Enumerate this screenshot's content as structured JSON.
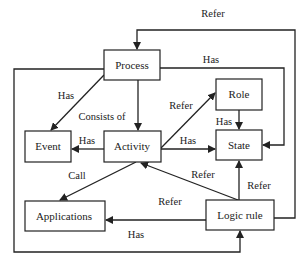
{
  "diagram": {
    "nodes": {
      "process": {
        "label": "Process"
      },
      "role": {
        "label": "Role"
      },
      "event": {
        "label": "Event"
      },
      "activity": {
        "label": "Activity"
      },
      "state": {
        "label": "State"
      },
      "applications": {
        "label": "Applications"
      },
      "logic_rule": {
        "label": "Logic rule"
      }
    },
    "edges": [
      {
        "from": "Logic rule",
        "to": "Process",
        "label": "Refer"
      },
      {
        "from": "Process",
        "to": "State",
        "label": "Has"
      },
      {
        "from": "Process",
        "to": "Event",
        "label": "Has"
      },
      {
        "from": "Process",
        "to": "Activity",
        "label": "Consists of"
      },
      {
        "from": "Process",
        "to": "Logic rule",
        "label": "Has"
      },
      {
        "from": "Activity",
        "to": "Role",
        "label": "Refer"
      },
      {
        "from": "Role",
        "to": "State",
        "label": "Has"
      },
      {
        "from": "Activity",
        "to": "Event",
        "label": "Has"
      },
      {
        "from": "Activity",
        "to": "State",
        "label": "Has"
      },
      {
        "from": "Activity",
        "to": "Applications",
        "label": "Call"
      },
      {
        "from": "Logic rule",
        "to": "Activity",
        "label": "Refer"
      },
      {
        "from": "Logic rule",
        "to": "State",
        "label": "Refer"
      },
      {
        "from": "Logic rule",
        "to": "Applications",
        "label": "Refer"
      }
    ]
  }
}
